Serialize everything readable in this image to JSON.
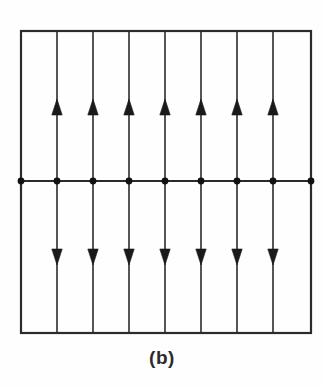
{
  "figure": {
    "caption": "(b)",
    "title": "",
    "colors": {
      "line": "#2b2b2b",
      "arrow": "#1a1a1a",
      "dot": "#111111",
      "background": "#fefefe",
      "caption": "#2b2b2b"
    },
    "frame": {
      "left": 21,
      "right": 311,
      "top": 31,
      "bottom": 333,
      "stroke_width": 2.2
    },
    "center_line": {
      "y": 181,
      "stroke_width": 2.2,
      "label": "charged-plane"
    },
    "field_lines": {
      "count": 9,
      "x_positions": [
        21,
        57,
        93,
        129,
        165,
        201,
        237,
        273,
        311
      ],
      "stroke_width": 1.6
    },
    "charge_dots": {
      "count": 9,
      "x_positions": [
        21,
        57,
        93,
        129,
        165,
        201,
        237,
        273,
        311
      ],
      "y": 181,
      "radius": 3.4
    },
    "arrows_up": {
      "count": 7,
      "x_positions": [
        57,
        93,
        129,
        165,
        201,
        237,
        273
      ],
      "tip_y": 99,
      "base_y": 115,
      "half_width": 5.2,
      "direction": "up"
    },
    "arrows_down": {
      "count": 7,
      "x_positions": [
        57,
        93,
        129,
        165,
        201,
        237,
        273
      ],
      "tip_y": 265,
      "base_y": 249,
      "half_width": 5.2,
      "direction": "down"
    }
  }
}
